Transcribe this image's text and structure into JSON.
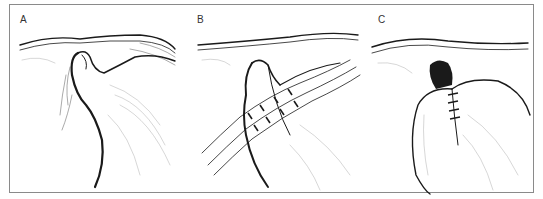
{
  "figure": {
    "panels": [
      {
        "id": "A",
        "label": "A",
        "description": "Tissue fold invaginating beneath membrane"
      },
      {
        "id": "B",
        "label": "B",
        "description": "Sutures placed through tissue fold"
      },
      {
        "id": "C",
        "label": "C",
        "description": "Sutures tied, fold closed"
      }
    ],
    "colors": {
      "ink": "#1a1a1a",
      "frame": "#8a8a8a",
      "background": "#ffffff"
    }
  }
}
